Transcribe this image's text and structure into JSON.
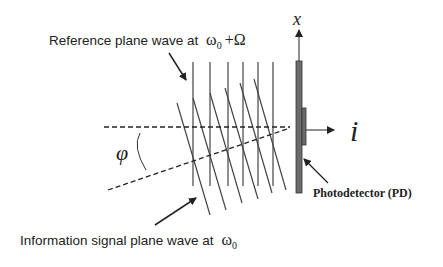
{
  "labels": {
    "reference_text": "Reference plane wave at",
    "reference_freq": "ω",
    "reference_sub": "0",
    "reference_plus": "+Ω",
    "information_text": "Information signal plane wave at",
    "information_freq": "ω",
    "information_sub": "0",
    "angle_symbol": "φ",
    "x_axis": "x",
    "current_symbol": "i",
    "photodetector": "Photodetector (PD)"
  },
  "colors": {
    "ink": "#222222",
    "detector_fill": "#6b6b6b",
    "background": "#ffffff"
  },
  "wavefronts": {
    "reference_count": 6,
    "information_count": 6
  }
}
